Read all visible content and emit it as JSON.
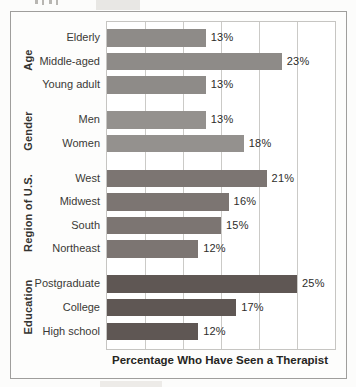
{
  "chart_data": {
    "type": "bar",
    "orientation": "horizontal",
    "title": "",
    "xlabel": "Percentage Who Have Seen a Therapist",
    "xlim": [
      0,
      30
    ],
    "grid": true,
    "grid_step": 5,
    "value_suffix": "%",
    "groups": [
      {
        "name": "Age",
        "color": "#8e8b88",
        "bars": [
          {
            "label": "Elderly",
            "value": 13,
            "value_label": "13%"
          },
          {
            "label": "Middle-aged",
            "value": 23,
            "value_label": "23%"
          },
          {
            "label": "Young adult",
            "value": 13,
            "value_label": "13%"
          }
        ]
      },
      {
        "name": "Gender",
        "color": "#94918e",
        "bars": [
          {
            "label": "Men",
            "value": 13,
            "value_label": "13%"
          },
          {
            "label": "Women",
            "value": 18,
            "value_label": "18%"
          }
        ]
      },
      {
        "name": "Region of U.S.",
        "color": "#7c7572",
        "bars": [
          {
            "label": "West",
            "value": 21,
            "value_label": "21%"
          },
          {
            "label": "Midwest",
            "value": 16,
            "value_label": "16%"
          },
          {
            "label": "South",
            "value": 15,
            "value_label": "15%"
          },
          {
            "label": "Northeast",
            "value": 12,
            "value_label": "12%"
          }
        ]
      },
      {
        "name": "Education",
        "color": "#5f5754",
        "bars": [
          {
            "label": "Postgraduate",
            "value": 25,
            "value_label": "25%"
          },
          {
            "label": "College",
            "value": 17,
            "value_label": "17%"
          },
          {
            "label": "High school",
            "value": 12,
            "value_label": "12%"
          }
        ]
      }
    ],
    "categories": [
      "Elderly",
      "Middle-aged",
      "Young adult",
      "Men",
      "Women",
      "West",
      "Midwest",
      "South",
      "Northeast",
      "Postgraduate",
      "College",
      "High school"
    ],
    "values": [
      13,
      23,
      13,
      13,
      18,
      21,
      16,
      15,
      12,
      25,
      17,
      12
    ]
  },
  "colors": {
    "box_border": "#9f9e9c",
    "plot_border": "#c6c5c2",
    "gridline": "#cbcac7",
    "category_text": "#3a3936",
    "value_text": "#2e2d2b"
  }
}
